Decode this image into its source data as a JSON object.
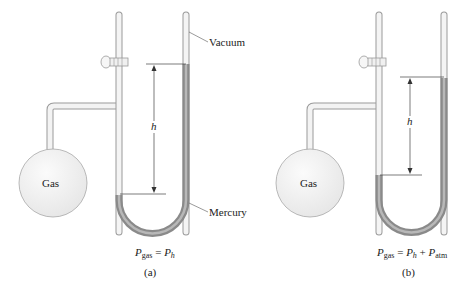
{
  "figure": {
    "panel_a": {
      "caption": "(a)",
      "bulb_label": "Gas",
      "height_label": "h",
      "callouts": {
        "top": "Vacuum",
        "bottom": "Mercury"
      },
      "equation": {
        "lhs_var": "P",
        "lhs_sub": "gas",
        "eq": "=",
        "rhs1_var": "P",
        "rhs1_sub": "h"
      }
    },
    "panel_b": {
      "caption": "(b)",
      "bulb_label": "Gas",
      "height_label": "h",
      "equation": {
        "lhs_var": "P",
        "lhs_sub": "gas",
        "eq": "=",
        "rhs1_var": "P",
        "rhs1_sub": "h",
        "plus": "+",
        "rhs2_var": "P",
        "rhs2_sub": "atm"
      }
    },
    "colors": {
      "glass": "#f3f3f3",
      "glass_edge": "#9a9a9a",
      "mercury": "#8a8a8a",
      "mercury_core": "#b8b8b8",
      "line": "#444444"
    }
  }
}
